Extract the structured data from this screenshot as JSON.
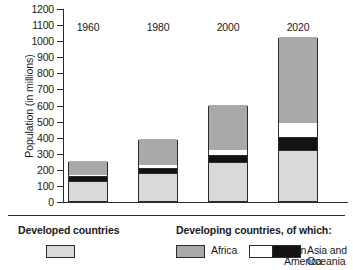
{
  "chart_data": {
    "type": "bar",
    "subtype": "stacked-bar",
    "title": "",
    "xlabel": "",
    "ylabel": "Population (in millions)",
    "categories": [
      "1960",
      "1980",
      "2000",
      "2020"
    ],
    "ylim": [
      0,
      1200
    ],
    "ytick_step": 100,
    "yticks": [
      0,
      100,
      200,
      300,
      400,
      500,
      600,
      700,
      800,
      900,
      1000,
      1100,
      1200
    ],
    "ytick_labels": [
      "0",
      "100",
      "200",
      "300",
      "400",
      "500",
      "600",
      "700",
      "800",
      "900",
      "1000",
      "1100",
      "1200"
    ],
    "grid": false,
    "legend_position": "bottom",
    "stack_order_bottom_to_top": [
      "Developed countries",
      "Asia and Oceania",
      "Latin America",
      "Africa"
    ],
    "series": [
      {
        "name": "Developed countries",
        "color": "#d9d9d9",
        "values": [
          120,
          170,
          235,
          310
        ]
      },
      {
        "name": "Asia and Oceania",
        "color": "#131313",
        "values": [
          32,
          30,
          45,
          80
        ]
      },
      {
        "name": "Latin America",
        "color": "#ffffff",
        "values": [
          10,
          22,
          40,
          97
        ]
      },
      {
        "name": "Africa",
        "color": "#a9a9a9",
        "values": [
          86,
          163,
          278,
          533
        ]
      }
    ],
    "totals": [
      248,
      385,
      598,
      1020
    ]
  },
  "axis": {
    "y_title": "Population (in millions)"
  },
  "legend": {
    "heading_developed": "Developed countries",
    "heading_developing": "Developing countries, of which:",
    "entries": [
      {
        "label": "",
        "color": "#d9d9d9",
        "swatch_name": "legend-swatch-developed"
      },
      {
        "label": "Africa",
        "color": "#a9a9a9",
        "swatch_name": "legend-swatch-africa"
      },
      {
        "label": "Latin\nAmerica",
        "label_line1": "Latin",
        "label_line2": "America",
        "color": "#ffffff",
        "swatch_name": "legend-swatch-latin-america"
      },
      {
        "label": "Asia and\nOceania",
        "label_line1": "Asia and",
        "label_line2": "Oceania",
        "color": "#131313",
        "swatch_name": "legend-swatch-asia-oceania"
      }
    ]
  }
}
